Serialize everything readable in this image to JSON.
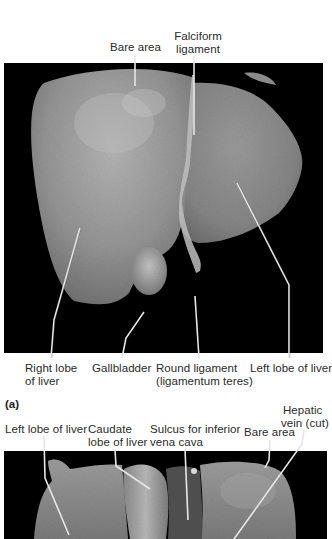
{
  "figure": {
    "panel_a": {
      "letter": "(a)",
      "labels": {
        "bare_area": "Bare area",
        "falciform_1": "Falciform",
        "falciform_2": "ligament",
        "right_lobe_1": "Right lobe",
        "right_lobe_2": "of liver",
        "gallbladder": "Gallbladder",
        "round_lig_1": "Round ligament",
        "round_lig_2": "(ligamentum teres)",
        "left_lobe": "Left lobe of liver"
      }
    },
    "panel_b": {
      "labels": {
        "left_lobe": "Left lobe of liver",
        "caudate_1": "Caudate",
        "caudate_2": "lobe of liver",
        "sulcus_1": "Sulcus for inferior",
        "sulcus_2": "vena cava",
        "bare_area": "Bare area",
        "hepatic_1": "Hepatic",
        "hepatic_2": "vein (cut)"
      }
    },
    "colors": {
      "background": "#000000",
      "tissue": "#8c8c8c",
      "tissue_light": "#a8a8a8",
      "leader_line": "#e8e8e8"
    }
  }
}
